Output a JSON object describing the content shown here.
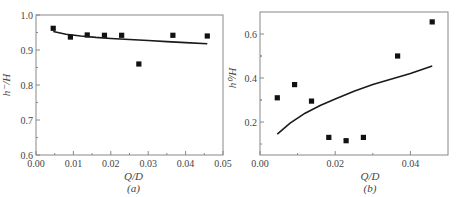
{
  "chart_data": [
    {
      "id": "a",
      "type": "scatter",
      "panel_label": "(a)",
      "title": "",
      "xlabel": "Q/D",
      "ylabel": "h⁻/H",
      "xlim": [
        0.0,
        0.05
      ],
      "ylim": [
        0.6,
        1.0
      ],
      "xticks": [
        "0.00",
        "0.01",
        "0.02",
        "0.03",
        "0.04",
        "0.05"
      ],
      "yticks": [
        "0.6",
        "0.7",
        "0.8",
        "0.9",
        "1.0"
      ],
      "grid": false,
      "series": [
        {
          "name": "measured",
          "kind": "scatter",
          "marker": "square",
          "x": [
            0.0046,
            0.0092,
            0.0137,
            0.0183,
            0.0229,
            0.0275,
            0.0366,
            0.0458
          ],
          "y": [
            0.962,
            0.937,
            0.943,
            0.942,
            0.942,
            0.86,
            0.942,
            0.94
          ]
        },
        {
          "name": "fitted",
          "kind": "line",
          "x": [
            0.0046,
            0.008,
            0.012,
            0.016,
            0.02,
            0.025,
            0.03,
            0.035,
            0.04,
            0.0458
          ],
          "y": [
            0.953,
            0.945,
            0.94,
            0.936,
            0.933,
            0.93,
            0.927,
            0.924,
            0.921,
            0.918
          ]
        }
      ]
    },
    {
      "id": "b",
      "type": "scatter",
      "panel_label": "(b)",
      "title": "",
      "xlabel": "Q/D",
      "ylabel": "h⁰/H",
      "xlim": [
        0.0,
        0.05
      ],
      "ylim": [
        0.05,
        0.7
      ],
      "xticks": [
        "0.00",
        "0.02",
        "0.04"
      ],
      "yticks": [
        "0.2",
        "0.4",
        "0.6"
      ],
      "grid": false,
      "series": [
        {
          "name": "measured",
          "kind": "scatter",
          "marker": "square",
          "x": [
            0.0046,
            0.0092,
            0.0137,
            0.0183,
            0.0229,
            0.0275,
            0.0366,
            0.0458
          ],
          "y": [
            0.31,
            0.37,
            0.295,
            0.13,
            0.115,
            0.13,
            0.5,
            0.655
          ]
        },
        {
          "name": "fitted",
          "kind": "line",
          "x": [
            0.0046,
            0.008,
            0.012,
            0.016,
            0.02,
            0.025,
            0.03,
            0.035,
            0.04,
            0.0458
          ],
          "y": [
            0.145,
            0.195,
            0.24,
            0.275,
            0.305,
            0.34,
            0.37,
            0.395,
            0.42,
            0.455
          ]
        }
      ]
    }
  ]
}
